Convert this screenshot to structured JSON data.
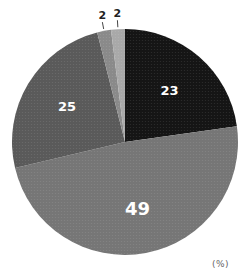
{
  "chart_data": {
    "type": "pie",
    "title": "",
    "unit": "(%)",
    "start_angle_deg": -90,
    "direction": "clockwise",
    "slices": [
      {
        "label": "23",
        "value": 23,
        "color": "#151515",
        "label_pos": "inside",
        "font_size": 13
      },
      {
        "label": "49",
        "value": 49,
        "color": "#767676",
        "label_pos": "inside",
        "font_size": 18
      },
      {
        "label": "25",
        "value": 25,
        "color": "#5a5a5a",
        "label_pos": "inside",
        "font_size": 13
      },
      {
        "label": "2",
        "value": 2,
        "color": "#8a8a8a",
        "label_pos": "outside",
        "font_size": 11
      },
      {
        "label": "2",
        "value": 2,
        "color": "#a9a9a9",
        "label_pos": "outside",
        "font_size": 11
      }
    ],
    "center": [
      125,
      142
    ],
    "radius": 113
  },
  "unit_label": "(%)"
}
